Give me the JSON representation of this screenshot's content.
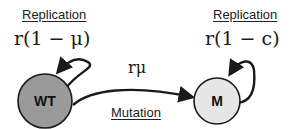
{
  "nodes": [
    {
      "id": "WT",
      "label": "WT",
      "fill": "#9a9a9a"
    },
    {
      "id": "M",
      "label": "M",
      "fill": "#e6e6e6"
    }
  ],
  "left_replication": {
    "title": "Replication",
    "rate": "r(1 − μ)"
  },
  "right_replication": {
    "title": "Replication",
    "rate": "r(1 − c)"
  },
  "mutation": {
    "title": "Mutation",
    "rate": "rμ"
  },
  "colors": {
    "stroke": "#1a1a1a",
    "wt_fill": "#9a9a9a",
    "m_fill": "#e6e6e6"
  }
}
